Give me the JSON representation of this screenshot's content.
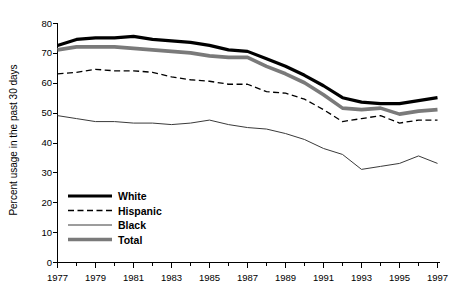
{
  "chart_data": {
    "type": "line",
    "title": "",
    "xlabel": "",
    "ylabel": "Percent usage in the past 30 days",
    "xlim": [
      1977,
      1997
    ],
    "ylim": [
      0,
      80
    ],
    "grid": false,
    "legend_position": "lower-left-inside",
    "x": [
      1977,
      1978,
      1979,
      1980,
      1981,
      1982,
      1983,
      1984,
      1985,
      1986,
      1987,
      1988,
      1989,
      1990,
      1991,
      1992,
      1993,
      1994,
      1995,
      1996,
      1997
    ],
    "xticks": [
      1977,
      1979,
      1981,
      1983,
      1985,
      1987,
      1989,
      1991,
      1993,
      1995,
      1997
    ],
    "xtick_labels": [
      "1977",
      "1979",
      "1981",
      "1983",
      "1985",
      "1987",
      "1989",
      "1991",
      "1993",
      "1995",
      "1997"
    ],
    "yticks": [
      0,
      10,
      20,
      30,
      40,
      50,
      60,
      70,
      80
    ],
    "ytick_labels": [
      "0",
      "10",
      "20",
      "30",
      "40",
      "50",
      "60",
      "70",
      "80"
    ],
    "series": [
      {
        "name": "White",
        "style": "solid",
        "width": 3.2,
        "color": "#000000",
        "values": [
          72.5,
          74.5,
          75.0,
          75.0,
          75.5,
          74.5,
          74.0,
          73.5,
          72.5,
          71.0,
          70.5,
          68.0,
          65.5,
          62.5,
          59.0,
          55.0,
          53.5,
          53.0,
          53.0,
          54.0,
          55.0
        ]
      },
      {
        "name": "Hispanic",
        "style": "dashed",
        "width": 1.3,
        "color": "#000000",
        "values": [
          63.0,
          63.5,
          64.5,
          64.0,
          64.0,
          63.5,
          62.0,
          61.0,
          60.5,
          59.5,
          59.5,
          57.0,
          56.5,
          54.5,
          51.0,
          47.0,
          48.0,
          49.0,
          46.5,
          47.5,
          47.5
        ]
      },
      {
        "name": "Black",
        "style": "solid",
        "width": 1.0,
        "color": "#3a3a3a",
        "values": [
          49.0,
          48.0,
          47.0,
          47.0,
          46.5,
          46.5,
          46.0,
          46.5,
          47.5,
          46.0,
          45.0,
          44.5,
          43.0,
          41.0,
          38.0,
          36.0,
          31.0,
          32.0,
          33.0,
          35.5,
          33.0
        ]
      },
      {
        "name": "Total",
        "style": "solid",
        "width": 3.6,
        "color": "#7a7a7a",
        "values": [
          71.0,
          72.0,
          72.0,
          72.0,
          71.5,
          71.0,
          70.5,
          70.0,
          69.0,
          68.5,
          68.5,
          65.5,
          63.0,
          60.0,
          56.0,
          51.5,
          51.0,
          51.5,
          49.5,
          50.5,
          51.0
        ]
      }
    ]
  },
  "legend": {
    "entries": [
      {
        "label": "White"
      },
      {
        "label": "Hispanic"
      },
      {
        "label": "Black"
      },
      {
        "label": "Total"
      }
    ]
  }
}
